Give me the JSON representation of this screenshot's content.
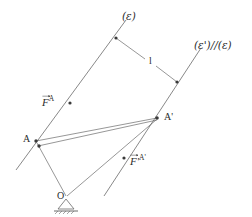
{
  "figure": {
    "background_color": "#ffffff",
    "stroke_color": "#5a5a5a",
    "text_color": "#2b2b2b",
    "width": 252,
    "height": 217
  },
  "labels": {
    "line_epsilon": "(ε)",
    "line_epsilon_prime": "(ε')//(ε)",
    "distance": "l",
    "point_a": "A",
    "point_a_prime": "A'",
    "origin": "O",
    "force_a_base": "F",
    "force_a_sup": "A",
    "force_a_prime_base": "F'",
    "force_a_prime_sup": "A'"
  },
  "geometry": {
    "line_epsilon": {
      "x1": 16,
      "y1": 170,
      "x2": 126,
      "y2": 20
    },
    "line_epsilon_prime": {
      "x1": 104,
      "y1": 196,
      "x2": 201,
      "y2": 48
    },
    "segment_l": {
      "x1": 116,
      "y1": 38,
      "x2": 177,
      "y2": 82
    },
    "segment_a_to_a_prime": {
      "x1": 36,
      "y1": 141,
      "x2": 157,
      "y2": 118
    },
    "segment_o_to_a": {
      "x1": 66,
      "y1": 196,
      "x2": 36,
      "y2": 142
    },
    "segment_o_to_a_prime": {
      "x1": 67,
      "y1": 196,
      "x2": 156,
      "y2": 119
    },
    "support_origin": {
      "x": 66,
      "y": 198
    },
    "dots": [
      {
        "name": "dot-epsilon-upper",
        "x": 116,
        "y": 38
      },
      {
        "name": "dot-epsilon-prime-mid",
        "x": 177,
        "y": 82
      },
      {
        "name": "dot-force-a-tip",
        "x": 70,
        "y": 103
      },
      {
        "name": "dot-point-a",
        "x": 36,
        "y": 141
      },
      {
        "name": "dot-point-a-lower",
        "x": 39,
        "y": 146
      },
      {
        "name": "dot-point-a-prime",
        "x": 157,
        "y": 118
      },
      {
        "name": "dot-force-a-prime-tip",
        "x": 124,
        "y": 158
      }
    ]
  },
  "label_positions": {
    "line_epsilon": {
      "left": 122,
      "top": 11
    },
    "line_epsilon_prime": {
      "left": 196,
      "top": 40
    },
    "distance": {
      "left": 150,
      "top": 57
    },
    "point_a": {
      "left": 24,
      "top": 134
    },
    "point_a_prime": {
      "left": 163,
      "top": 113
    },
    "origin": {
      "left": 58,
      "top": 192
    },
    "force_a": {
      "left": 43,
      "top": 95
    },
    "force_a_prime": {
      "left": 131,
      "top": 154
    }
  }
}
